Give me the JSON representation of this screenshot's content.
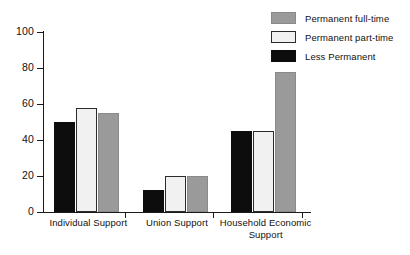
{
  "chart_data": {
    "type": "bar",
    "title": "",
    "subtitle": "",
    "xlabel": "",
    "ylabel": "",
    "ylim": [
      0,
      100
    ],
    "yticks": [
      0,
      20,
      40,
      60,
      80,
      100
    ],
    "grid": false,
    "legend_position": "top-right",
    "categories": [
      "Individual Support",
      "Union Support",
      "Household Economic Support"
    ],
    "category_lines": [
      [
        "Individual Support"
      ],
      [
        "Union Support"
      ],
      [
        "Household Economic",
        "Support"
      ]
    ],
    "series": [
      {
        "name": "Less Permanent",
        "color": "#0d0d0d",
        "values": [
          50,
          12,
          45
        ]
      },
      {
        "name": "Permanent part-time",
        "color": "#f1f1f1",
        "values": [
          58,
          20,
          45
        ]
      },
      {
        "name": "Permanent full-time",
        "color": "#9a9a9a",
        "values": [
          55,
          20,
          78
        ]
      }
    ],
    "legend_order": [
      {
        "name": "Permanent full-time",
        "color": "#9a9a9a"
      },
      {
        "name": "Permanent part-time",
        "color": "#f1f1f1"
      },
      {
        "name": "Less Permanent",
        "color": "#0d0d0d"
      }
    ]
  },
  "axis": {
    "y_tick_labels": [
      "0",
      "20",
      "40",
      "60",
      "80",
      "100"
    ]
  },
  "legend": {
    "items": [
      {
        "label": "Permanent full-time"
      },
      {
        "label": "Permanent part-time"
      },
      {
        "label": "Less Permanent"
      }
    ]
  }
}
